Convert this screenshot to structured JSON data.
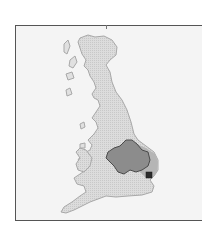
{
  "map": {
    "subject": "Great Britain",
    "highlighted_region": "East of England / East Midlands",
    "colors": {
      "background": "#ffffff",
      "frame_fill": "#f4f4f4",
      "frame_border": "#555555",
      "land_fill": "#d9d9d9",
      "land_outline": "#a8a8a8",
      "region_fill": "#8c8c8c",
      "region_outline": "#4a4a4a",
      "region_halo": "#b5b5b5",
      "marker": "#2b2b2b"
    },
    "marker": {
      "shape": "square",
      "label": ""
    }
  }
}
